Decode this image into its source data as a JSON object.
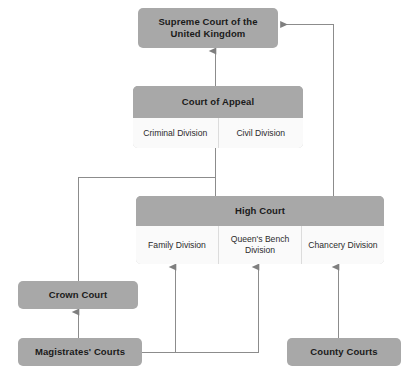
{
  "diagram": {
    "colors": {
      "header_fill": "#a8a8a8",
      "division_fill": "#fafafa",
      "division_border": "#dcdcdc",
      "connector": "#8c8c8c",
      "text": "#1a1a1a",
      "background": "#ffffff"
    },
    "nodes": {
      "supreme": {
        "label": "Supreme Court of the\nUnited Kingdom",
        "line1": "Supreme Court of the",
        "line2": "United Kingdom"
      },
      "appeal": {
        "label": "Court of Appeal",
        "divisions": [
          {
            "label": "Criminal Division"
          },
          {
            "label": "Civil Division"
          }
        ]
      },
      "high": {
        "label": "High Court",
        "divisions": [
          {
            "label": "Family Division"
          },
          {
            "line1": "Queen's Bench",
            "line2": "Division"
          },
          {
            "label": "Chancery Division"
          }
        ]
      },
      "crown": {
        "label": "Crown Court"
      },
      "magistrates": {
        "label": "Magistrates' Courts"
      },
      "county": {
        "label": "County Courts"
      }
    },
    "connectors": [
      {
        "name": "appeal-to-supreme",
        "from": "Court of Appeal",
        "to": "Supreme Court of the United Kingdom",
        "arrow": "up"
      },
      {
        "name": "high-to-supreme",
        "from": "High Court",
        "to": "Supreme Court of the United Kingdom",
        "arrow": "left",
        "routing": "up-right-then-left"
      },
      {
        "name": "high-to-appeal",
        "from": "High Court",
        "to": "Court of Appeal",
        "arrow": "none"
      },
      {
        "name": "crown-to-appeal",
        "from": "Crown Court",
        "to": "Court of Appeal",
        "arrow": "none",
        "routing": "up-then-right"
      },
      {
        "name": "magistrates-to-crown",
        "from": "Magistrates' Courts",
        "to": "Crown Court",
        "arrow": "up"
      },
      {
        "name": "magistrates-to-family-division",
        "from": "Magistrates' Courts",
        "to": "Family Division",
        "arrow": "up"
      },
      {
        "name": "magistrates-to-queens-bench-division",
        "from": "Magistrates' Courts",
        "to": "Queen's Bench Division",
        "arrow": "up"
      },
      {
        "name": "county-to-chancery-division",
        "from": "County Courts",
        "to": "Chancery Division",
        "arrow": "up"
      }
    ]
  }
}
